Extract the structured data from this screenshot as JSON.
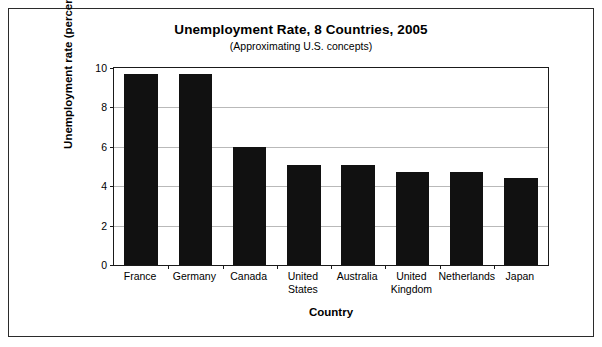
{
  "chart_data": {
    "type": "bar",
    "title": "Unemployment Rate, 8 Countries, 2005",
    "subtitle": "(Approximating U.S. concepts)",
    "xlabel": "Country",
    "ylabel": "Unemployment rate (percent)",
    "categories": [
      "France",
      "Germany",
      "Canada",
      "United States",
      "Australia",
      "United Kingdom",
      "Netherlands",
      "Japan"
    ],
    "values": [
      9.7,
      9.7,
      6.0,
      5.1,
      5.1,
      4.7,
      4.7,
      4.4
    ],
    "ylim": [
      0,
      10
    ],
    "yticks": [
      0,
      2,
      4,
      6,
      8,
      10
    ],
    "ytick_labels": [
      "0",
      "2",
      "4",
      "6",
      "8",
      "10"
    ],
    "grid": true,
    "legend": false,
    "bar_color": "#111111",
    "grid_color": "#b9b9b9",
    "axis_color": "#1a1a1a",
    "background": "#ffffff"
  }
}
